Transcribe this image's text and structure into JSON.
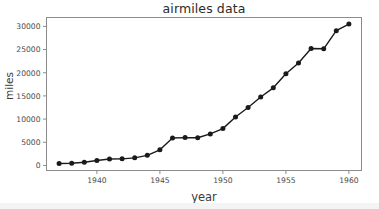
{
  "figure": {
    "background_color": "#ffffff",
    "frame_color": "#8c8c8c",
    "line_color": "#1a1a1a",
    "marker_color": "#1a1a1a",
    "title": "airmiles data",
    "xlabel": "year",
    "ylabel": "miles"
  },
  "chart_data": {
    "type": "line",
    "title": "airmiles data",
    "xlabel": "year",
    "ylabel": "miles",
    "x": [
      1937,
      1938,
      1939,
      1940,
      1941,
      1942,
      1943,
      1944,
      1945,
      1946,
      1947,
      1948,
      1949,
      1950,
      1951,
      1952,
      1953,
      1954,
      1955,
      1956,
      1957,
      1958,
      1959,
      1960
    ],
    "values": [
      412,
      480,
      683,
      1052,
      1385,
      1418,
      1634,
      2178,
      3362,
      5911,
      6003,
      5967,
      6806,
      7943,
      10445,
      12498,
      14762,
      16744,
      19771,
      22087,
      25222,
      25163,
      29081,
      30514
    ],
    "series": [
      {
        "name": "airmiles",
        "values": [
          412,
          480,
          683,
          1052,
          1385,
          1418,
          1634,
          2178,
          3362,
          5911,
          6003,
          5967,
          6806,
          7943,
          10445,
          12498,
          14762,
          16744,
          19771,
          22087,
          25222,
          25163,
          29081,
          30514
        ]
      }
    ],
    "xlim": [
      1936.0,
      1961.0
    ],
    "ylim": [
      -1093,
      31919
    ],
    "xticks": [
      1940,
      1945,
      1950,
      1955,
      1960
    ],
    "xtick_labels": [
      "1940",
      "1945",
      "1950",
      "1955",
      "1960"
    ],
    "yticks": [
      0,
      5000,
      10000,
      15000,
      20000,
      25000,
      30000
    ],
    "ytick_labels": [
      "0",
      "5000",
      "10000",
      "15000",
      "20000",
      "25000",
      "30000"
    ],
    "grid": false,
    "legend": null,
    "marker": "circle",
    "line_style": "solid"
  }
}
